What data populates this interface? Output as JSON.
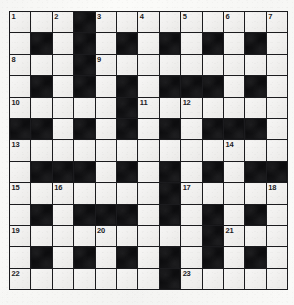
{
  "puzzle": {
    "type": "crossword-grid",
    "title": "Crossword Puzzle Grid",
    "columns": 13,
    "rows": 13,
    "colors": {
      "paper": "#fbfbf9",
      "white_cell": "#edecea",
      "black_cell": "#121214",
      "grid_line": "#1b1b1e",
      "clue_number": "#1c1c1f"
    },
    "black_cells_by_row": [
      [
        4
      ],
      [
        2,
        4,
        6,
        8,
        10,
        12
      ],
      [
        4
      ],
      [
        2,
        4,
        6,
        8,
        9,
        10,
        12
      ],
      [
        6
      ],
      [
        1,
        2,
        4,
        6,
        8,
        10,
        11,
        12
      ],
      [],
      [
        2,
        3,
        4,
        6,
        8,
        10,
        12,
        13
      ],
      [
        8
      ],
      [
        2,
        4,
        5,
        6,
        8,
        10,
        12
      ],
      [
        10
      ],
      [
        2,
        4,
        6,
        8,
        10,
        12
      ],
      [
        8
      ]
    ],
    "clue_numbers": [
      {
        "label": "1",
        "row": 1,
        "col": 1
      },
      {
        "label": "2",
        "row": 1,
        "col": 3
      },
      {
        "label": "3",
        "row": 1,
        "col": 5
      },
      {
        "label": "4",
        "row": 1,
        "col": 7
      },
      {
        "label": "5",
        "row": 1,
        "col": 9
      },
      {
        "label": "6",
        "row": 1,
        "col": 11
      },
      {
        "label": "7",
        "row": 1,
        "col": 13
      },
      {
        "label": "8",
        "row": 3,
        "col": 1
      },
      {
        "label": "9",
        "row": 3,
        "col": 5
      },
      {
        "label": "10",
        "row": 5,
        "col": 1
      },
      {
        "label": "11",
        "row": 5,
        "col": 7
      },
      {
        "label": "12",
        "row": 5,
        "col": 9
      },
      {
        "label": "13",
        "row": 7,
        "col": 1
      },
      {
        "label": "14",
        "row": 7,
        "col": 11
      },
      {
        "label": "15",
        "row": 9,
        "col": 1
      },
      {
        "label": "16",
        "row": 9,
        "col": 3
      },
      {
        "label": "17",
        "row": 9,
        "col": 9
      },
      {
        "label": "18",
        "row": 9,
        "col": 13
      },
      {
        "label": "19",
        "row": 11,
        "col": 1
      },
      {
        "label": "20",
        "row": 11,
        "col": 5
      },
      {
        "label": "21",
        "row": 11,
        "col": 11
      },
      {
        "label": "22",
        "row": 13,
        "col": 1
      },
      {
        "label": "23",
        "row": 13,
        "col": 9
      }
    ],
    "entered_letters": []
  }
}
